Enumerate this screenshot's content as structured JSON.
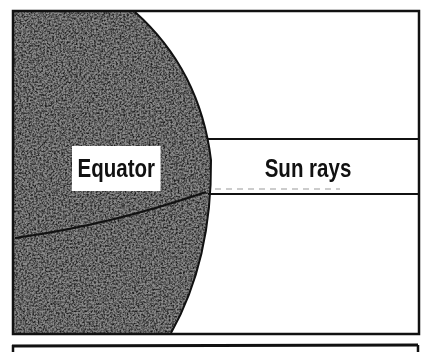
{
  "diagram": {
    "labels": {
      "equator": "Equator",
      "sun_rays": "Sun rays"
    },
    "colors": {
      "frame": "#111111",
      "globe_dark": "#3a3a3a",
      "globe_light": "#9a9a9a",
      "background": "#ffffff"
    },
    "elements": [
      "globe",
      "equator-line",
      "sun-rays-band",
      "frame"
    ]
  }
}
